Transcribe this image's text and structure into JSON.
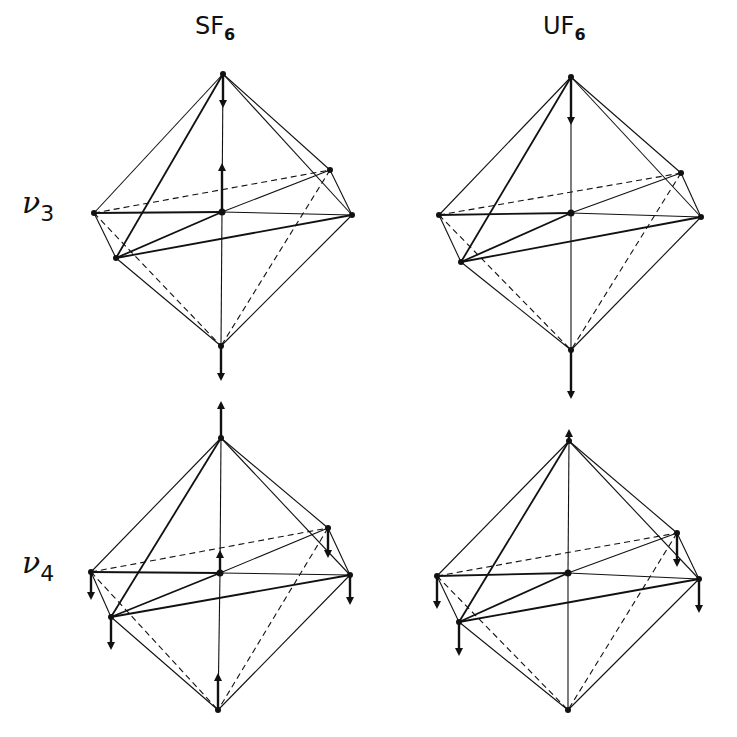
{
  "columns": [
    {
      "id": "sf6",
      "label_main": "SF",
      "label_sub": "6",
      "x": 195
    },
    {
      "id": "uf6",
      "label_main": "UF",
      "label_sub": "6",
      "x": 543
    }
  ],
  "rows": [
    {
      "id": "nu3",
      "label_main": "ν",
      "label_sub": "3",
      "y": 185
    },
    {
      "id": "nu4",
      "label_main": "ν",
      "label_sub": "4",
      "y": 545
    }
  ],
  "colors": {
    "ink": "#111111",
    "background": "#ffffff"
  },
  "panels": [
    {
      "id": "sf6-nu3",
      "vertices": {
        "top": [
          223,
          74
        ],
        "center": [
          222,
          212
        ],
        "left": [
          94,
          213
        ],
        "frontleft": [
          116,
          258
        ],
        "backright": [
          330,
          170
        ],
        "right": [
          352,
          215
        ],
        "bottom": [
          221,
          346
        ]
      },
      "arrows": [
        {
          "from": "top",
          "to": [
            223,
            105
          ]
        },
        {
          "from": "center",
          "to": [
            222,
            166
          ]
        },
        {
          "from": "bottom",
          "to": [
            221,
            378
          ]
        }
      ]
    },
    {
      "id": "uf6-nu3",
      "vertices": {
        "top": [
          571,
          77
        ],
        "center": [
          571,
          213
        ],
        "left": [
          439,
          215
        ],
        "frontleft": [
          461,
          262
        ],
        "backright": [
          681,
          173
        ],
        "right": [
          701,
          217
        ],
        "bottom": [
          571,
          350
        ]
      },
      "arrows": [
        {
          "from": "top",
          "to": [
            571,
            122
          ]
        },
        {
          "from": "bottom",
          "to": [
            571,
            396
          ]
        }
      ]
    },
    {
      "id": "sf6-nu4",
      "vertices": {
        "top": [
          221,
          438
        ],
        "center": [
          220,
          573
        ],
        "left": [
          91,
          572
        ],
        "frontleft": [
          111,
          617
        ],
        "backright": [
          328,
          528
        ],
        "right": [
          350,
          575
        ],
        "bottom": [
          218,
          710
        ]
      },
      "arrows": [
        {
          "from": "top",
          "to": [
            221,
            404
          ]
        },
        {
          "from": "center",
          "to": [
            220,
            553
          ]
        },
        {
          "from": "left",
          "to": [
            91,
            597
          ]
        },
        {
          "from": "backright",
          "to": [
            328,
            555
          ]
        },
        {
          "from": "right",
          "to": [
            350,
            602
          ]
        },
        {
          "from": "frontleft",
          "to": [
            111,
            647
          ]
        },
        {
          "from": "bottom",
          "to": [
            218,
            676
          ]
        }
      ]
    },
    {
      "id": "uf6-nu4",
      "vertices": {
        "top": [
          569,
          441
        ],
        "center": [
          568,
          573
        ],
        "left": [
          437,
          576
        ],
        "frontleft": [
          459,
          622
        ],
        "backright": [
          677,
          533
        ],
        "right": [
          699,
          579
        ],
        "bottom": [
          568,
          710
        ]
      },
      "arrows": [
        {
          "from": "top",
          "to": [
            569,
            432
          ]
        },
        {
          "from": "left",
          "to": [
            437,
            606
          ]
        },
        {
          "from": "backright",
          "to": [
            677,
            564
          ]
        },
        {
          "from": "right",
          "to": [
            699,
            610
          ]
        },
        {
          "from": "frontleft",
          "to": [
            459,
            653
          ]
        }
      ]
    }
  ],
  "edges": {
    "solid": [
      [
        "top",
        "left"
      ],
      [
        "top",
        "frontleft"
      ],
      [
        "top",
        "backright"
      ],
      [
        "top",
        "right"
      ],
      [
        "top",
        "center"
      ],
      [
        "center",
        "bottom"
      ],
      [
        "left",
        "center"
      ],
      [
        "center",
        "right"
      ],
      [
        "frontleft",
        "center"
      ],
      [
        "center",
        "backright"
      ],
      [
        "frontleft",
        "right"
      ],
      [
        "left",
        "frontleft"
      ],
      [
        "backright",
        "right"
      ],
      [
        "frontleft",
        "bottom"
      ],
      [
        "right",
        "bottom"
      ]
    ],
    "dashed": [
      [
        "left",
        "backright"
      ],
      [
        "left",
        "bottom"
      ],
      [
        "backright",
        "bottom"
      ]
    ]
  }
}
